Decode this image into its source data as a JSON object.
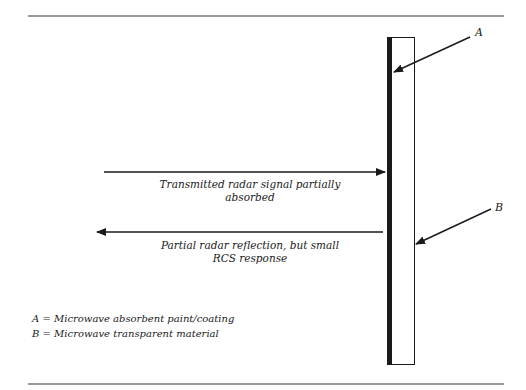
{
  "diagram": {
    "labels": {
      "A": "A",
      "B": "B"
    },
    "transmitted": {
      "line1": "Transmitted radar signal partially",
      "line2": "absorbed"
    },
    "reflected": {
      "line1": "Partial radar reflection, but small",
      "line2": "RCS response"
    },
    "key": [
      {
        "letter": "A",
        "text": "= Microwave absorbent paint/coating"
      },
      {
        "letter": "B",
        "text": "= Microwave transparent material"
      }
    ],
    "colors": {
      "ink": "#1a1a1a",
      "background": "#ffffff"
    }
  }
}
